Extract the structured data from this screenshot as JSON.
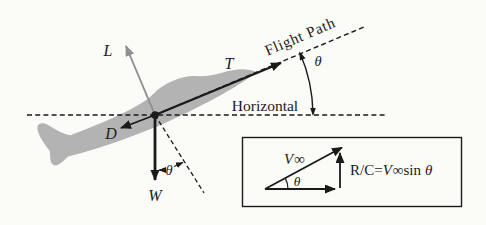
{
  "figure": {
    "colors": {
      "background": "#fbfbf8",
      "ink": "#1a1a1a",
      "plane": "#b3b3b3",
      "lift_arrow": "#8f8f8f"
    },
    "labels": {
      "lift": "L",
      "thrust": "T",
      "drag": "D",
      "weight": "W",
      "theta": "θ",
      "flight_path": "Flight Path",
      "horizontal": "Horizontal"
    },
    "inset": {
      "velocity_v": "V",
      "infinity": "∞",
      "theta": "θ",
      "eq_prefix": "R/C=",
      "eq_v": "V",
      "eq_inf": "∞",
      "eq_sin": "sin",
      "eq_theta": "θ"
    },
    "arrows": [
      {
        "name": "lift-arrow",
        "label": "L",
        "color": "#8f8f8f"
      },
      {
        "name": "thrust-arrow",
        "label": "T",
        "color": "#1a1a1a"
      },
      {
        "name": "drag-arrow",
        "label": "D",
        "color": "#1a1a1a"
      },
      {
        "name": "weight-arrow",
        "label": "W",
        "color": "#1a1a1a"
      },
      {
        "name": "velocity-arrow",
        "label": "V∞",
        "color": "#1a1a1a"
      }
    ]
  }
}
